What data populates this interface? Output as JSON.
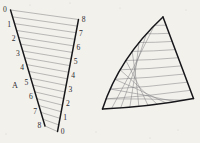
{
  "figure": {
    "background_color": "#f3f1ec",
    "ink_color": "#17171a",
    "chord_color": "#6e6e70"
  },
  "left_figure": {
    "name": "string-art-envelope",
    "marker_label": "A",
    "marker_position": {
      "x": 12,
      "y": 88
    },
    "left_arm": {
      "start": {
        "x": 10.5,
        "y": 10.0
      },
      "end": {
        "x": 45.0,
        "y": 126.0
      },
      "label_order": "top-to-bottom",
      "labels": [
        "0",
        "1",
        "2",
        "3",
        "4",
        "5",
        "6",
        "7",
        "8"
      ],
      "label_offset": {
        "dx": -7.5,
        "dy": 2.2
      }
    },
    "right_arm": {
      "start": {
        "x": 78.5,
        "y": 19.5
      },
      "end": {
        "x": 57.5,
        "y": 131.5
      },
      "label_order": "top-to-bottom",
      "labels": [
        "8",
        "7",
        "6",
        "5",
        "4",
        "3",
        "2",
        "1",
        "0"
      ],
      "label_offset": {
        "dx": 3.2,
        "dy": 2.2
      }
    },
    "chords_description": "point i on left arm joined to point i on right arm",
    "chord_count": 9,
    "subdivision_chords": 17
  },
  "right_figure": {
    "name": "curvilinear-triangle-mesh",
    "apex": {
      "x": 163.0,
      "y": 17.0
    },
    "right_corner": {
      "x": 193.5,
      "y": 98.5
    },
    "left_cusp": {
      "x": 102.5,
      "y": 109.0
    },
    "curved_edge_control": {
      "x": 119.0,
      "y": 58.0
    },
    "bottom_edge_control": {
      "x": 148.0,
      "y": 107.0
    },
    "mesh_lines_family_a": 9,
    "mesh_lines_family_b": 9
  },
  "chart_data": {
    "type": "line",
    "xlabel": "",
    "ylabel": "",
    "grid": false,
    "legend": "none",
    "series": [
      {
        "name": "left-arm-points",
        "labels": [
          "0",
          "1",
          "2",
          "3",
          "4",
          "5",
          "6",
          "7",
          "8"
        ],
        "x": [
          10.5,
          14.8,
          19.1,
          23.4,
          27.8,
          32.1,
          36.4,
          40.7,
          45.0
        ],
        "y": [
          10.0,
          24.5,
          39.0,
          53.5,
          68.0,
          82.5,
          97.0,
          111.5,
          126.0
        ]
      },
      {
        "name": "right-arm-points",
        "labels": [
          "8",
          "7",
          "6",
          "5",
          "4",
          "3",
          "2",
          "1",
          "0"
        ],
        "x": [
          78.5,
          75.9,
          73.2,
          70.6,
          68.0,
          65.4,
          62.7,
          60.1,
          57.5
        ],
        "y": [
          19.5,
          33.5,
          47.5,
          61.5,
          75.5,
          89.5,
          103.5,
          117.5,
          131.5
        ]
      }
    ],
    "connections": [
      [
        0,
        0
      ],
      [
        1,
        1
      ],
      [
        2,
        2
      ],
      [
        3,
        3
      ],
      [
        4,
        4
      ],
      [
        5,
        5
      ],
      [
        6,
        6
      ],
      [
        7,
        7
      ],
      [
        8,
        8
      ]
    ],
    "annotations": [
      {
        "text": "A",
        "x": 12,
        "y": 88
      }
    ]
  }
}
